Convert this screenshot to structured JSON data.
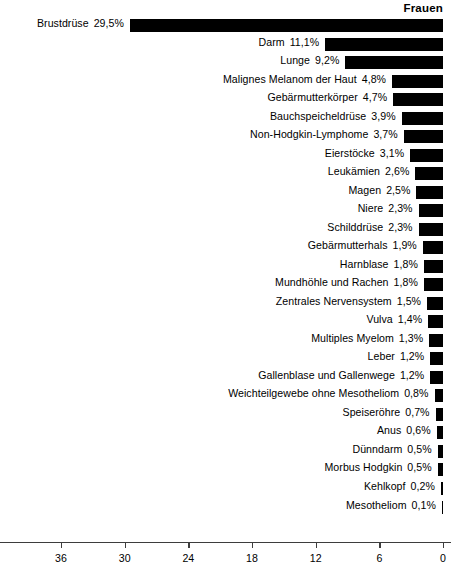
{
  "chart_data": {
    "type": "bar",
    "orientation": "horizontal-right-to-left",
    "title": "Frauen",
    "xlabel": "",
    "ylabel": "",
    "unit": "%",
    "xlim": [
      0,
      42.5
    ],
    "grid": false,
    "legend": null,
    "axis_ticks": [
      {
        "value": 36,
        "label": "36"
      },
      {
        "value": 30,
        "label": "30"
      },
      {
        "value": 24,
        "label": "24"
      },
      {
        "value": 18,
        "label": "18"
      },
      {
        "value": 12,
        "label": "12"
      },
      {
        "value": 6,
        "label": "6"
      },
      {
        "value": 0,
        "label": "0"
      }
    ],
    "bar_color": "#000000",
    "axis_color": "#3d3d3d",
    "categories": [
      "Brustdrüse",
      "Darm",
      "Lunge",
      "Malignes Melanom der Haut",
      "Gebärmutterkörper",
      "Bauchspeicheldrüse",
      "Non-Hodgkin-Lymphome",
      "Eierstöcke",
      "Leukämien",
      "Magen",
      "Niere",
      "Schilddrüse",
      "Gebärmutterhals",
      "Harnblase",
      "Mundhöhle und Rachen",
      "Zentrales Nervensystem",
      "Vulva",
      "Multiples Myelom",
      "Leber",
      "Gallenblase und Gallenwege",
      "Weichteilgewebe ohne Mesotheliom",
      "Speiseröhre",
      "Anus",
      "Dünndarm",
      "Morbus Hodgkin",
      "Kehlkopf",
      "Mesotheliom"
    ],
    "values": [
      29.5,
      11.1,
      9.2,
      4.8,
      4.7,
      3.9,
      3.7,
      3.1,
      2.6,
      2.5,
      2.3,
      2.3,
      1.9,
      1.8,
      1.8,
      1.5,
      1.4,
      1.3,
      1.2,
      1.2,
      0.8,
      0.7,
      0.6,
      0.5,
      0.5,
      0.2,
      0.1
    ],
    "value_labels": [
      "29,5%",
      "11,1%",
      "9,2%",
      "4,8%",
      "4,7%",
      "3,9%",
      "3,7%",
      "3,1%",
      "2,6%",
      "2,5%",
      "2,3%",
      "2,3%",
      "1,9%",
      "1,8%",
      "1,8%",
      "1,5%",
      "1,4%",
      "1,3%",
      "1,2%",
      "1,2%",
      "0,8%",
      "0,7%",
      "0,6%",
      "0,5%",
      "0,5%",
      "0,2%",
      "0,1%"
    ]
  }
}
